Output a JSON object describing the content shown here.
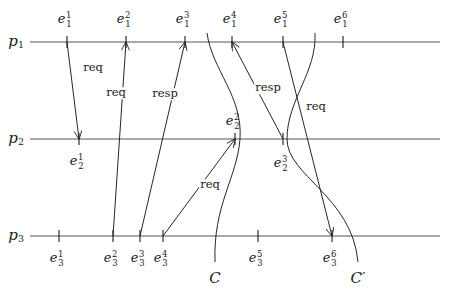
{
  "figure": {
    "type": "space-time-diagram",
    "width": 449,
    "height": 300,
    "background": "#ffffff",
    "ink_color": "#1a1a1a",
    "line_color": "#555555"
  },
  "processes": [
    {
      "id": "p1",
      "label": "p",
      "index": "1",
      "y": 42,
      "x_start": 30,
      "x_end": 440
    },
    {
      "id": "p2",
      "label": "p",
      "index": "2",
      "y": 139,
      "x_start": 30,
      "x_end": 440
    },
    {
      "id": "p3",
      "label": "p",
      "index": "3",
      "y": 236,
      "x_start": 30,
      "x_end": 440
    }
  ],
  "events": {
    "p1": [
      {
        "name": "e",
        "sub": "1",
        "sup": "1",
        "x": 67,
        "label_y": 18,
        "side": "above"
      },
      {
        "name": "e",
        "sub": "1",
        "sup": "2",
        "x": 126,
        "label_y": 18,
        "side": "above"
      },
      {
        "name": "e",
        "sub": "1",
        "sup": "3",
        "x": 185,
        "label_y": 18,
        "side": "above"
      },
      {
        "name": "e",
        "sub": "1",
        "sup": "4",
        "x": 232,
        "label_y": 18,
        "side": "above"
      },
      {
        "name": "e",
        "sub": "1",
        "sup": "5",
        "x": 283,
        "label_y": 18,
        "side": "above"
      },
      {
        "name": "e",
        "sub": "1",
        "sup": "6",
        "x": 343,
        "label_y": 18,
        "side": "above"
      }
    ],
    "p2": [
      {
        "name": "e",
        "sub": "2",
        "sup": "1",
        "x": 79,
        "label_y": 160,
        "side": "below"
      },
      {
        "name": "e",
        "sub": "2",
        "sup": "2",
        "x": 235,
        "label_y": 120,
        "side": "above"
      },
      {
        "name": "e",
        "sub": "2",
        "sup": "3",
        "x": 283,
        "label_y": 162,
        "side": "below"
      }
    ],
    "p3": [
      {
        "name": "e",
        "sub": "3",
        "sup": "1",
        "x": 59,
        "label_y": 257,
        "side": "below"
      },
      {
        "name": "e",
        "sub": "3",
        "sup": "2",
        "x": 113,
        "label_y": 257,
        "side": "below"
      },
      {
        "name": "e",
        "sub": "3",
        "sup": "3",
        "x": 140,
        "label_y": 257,
        "side": "below"
      },
      {
        "name": "e",
        "sub": "3",
        "sup": "4",
        "x": 163,
        "label_y": 257,
        "side": "below"
      },
      {
        "name": "e",
        "sub": "3",
        "sup": "5",
        "x": 258,
        "label_y": 257,
        "side": "below"
      },
      {
        "name": "e",
        "sub": "3",
        "sup": "6",
        "x": 332,
        "label_y": 257,
        "side": "below"
      }
    ]
  },
  "messages": [
    {
      "id": "m1",
      "label": "req",
      "from": "e_1^1",
      "to": "e_2^1",
      "label_x": 93,
      "label_y": 68,
      "x1": 67,
      "y1": 42,
      "x2": 79,
      "y2": 139
    },
    {
      "id": "m2",
      "label": "req",
      "from": "e_3^2",
      "to": "e_1^2",
      "label_x": 116,
      "label_y": 93,
      "x1": 113,
      "y1": 236,
      "x2": 126,
      "y2": 42
    },
    {
      "id": "m3",
      "label": "resp",
      "from": "e_3^3",
      "to": "e_1^3",
      "label_x": 165,
      "label_y": 94,
      "x1": 140,
      "y1": 236,
      "x2": 185,
      "y2": 42
    },
    {
      "id": "m4",
      "label": "req",
      "from": "e_3^4",
      "to": "e_2^2",
      "label_x": 210,
      "label_y": 185,
      "x1": 163,
      "y1": 236,
      "x2": 235,
      "y2": 139
    },
    {
      "id": "m5",
      "label": "resp",
      "from": "e_2^3",
      "to": "e_1^4",
      "label_x": 268,
      "label_y": 88,
      "x1": 283,
      "y1": 139,
      "x2": 232,
      "y2": 42
    },
    {
      "id": "m6",
      "label": "req",
      "from": "e_1^5",
      "to": "e_3^6",
      "label_x": 316,
      "label_y": 107,
      "x1": 283,
      "y1": 42,
      "x2": 332,
      "y2": 236
    }
  ],
  "cuts": [
    {
      "id": "C",
      "label": "C",
      "label_x": 215,
      "label_y": 278,
      "consistent": true,
      "path": "M 207 33 C 212 70, 243 96, 240 139 C 237 178, 213 205, 215 262"
    },
    {
      "id": "Cp",
      "label": "C′",
      "label_x": 358,
      "label_y": 278,
      "consistent": false,
      "path": "M 315 33 C 317 72, 287 100, 287 139 C 287 176, 352 196, 358 262"
    }
  ],
  "notes": {
    "tick_half_height": 6,
    "arrowhead": "open-v"
  }
}
